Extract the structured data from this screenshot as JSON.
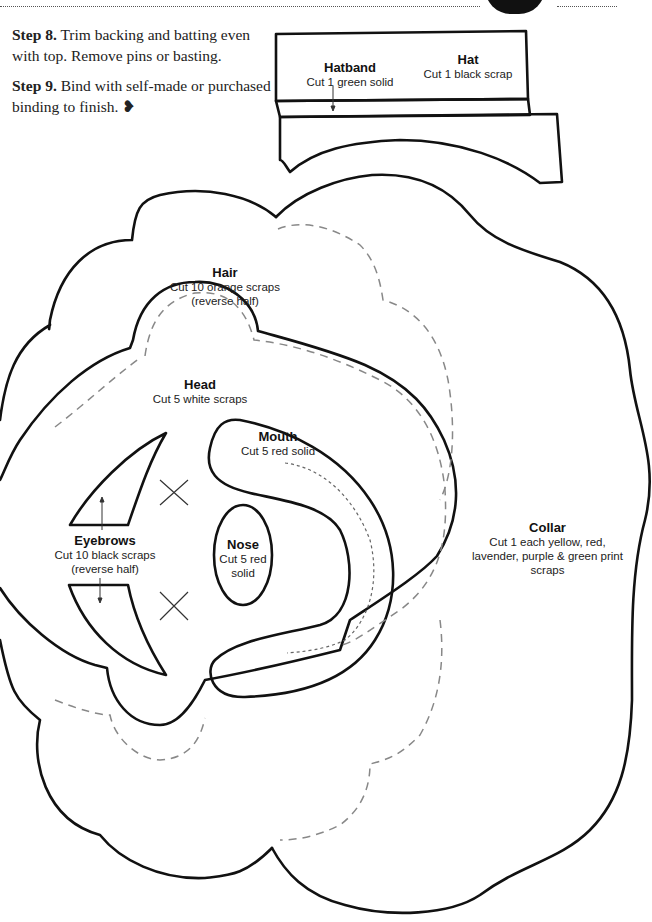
{
  "steps": [
    {
      "label": "Step 8.",
      "text": "Trim backing and batting even with top. Remove pins or basting."
    },
    {
      "label": "Step 9.",
      "text": "Bind with self-made or purchased binding to finish.",
      "end_mark": "❥"
    }
  ],
  "pieces": {
    "hatband": {
      "title": "Hatband",
      "line1": "Cut 1 green solid"
    },
    "hat": {
      "title": "Hat",
      "line1": "Cut 1 black scrap"
    },
    "hair": {
      "title": "Hair",
      "line1": "Cut 10 orange scraps",
      "line2": "(reverse half)"
    },
    "head": {
      "title": "Head",
      "line1": "Cut 5 white scraps"
    },
    "mouth": {
      "title": "Mouth",
      "line1": "Cut 5 red solid"
    },
    "eyebrows": {
      "title": "Eyebrows",
      "line1": "Cut 10 black scraps",
      "line2": "(reverse half)"
    },
    "nose": {
      "title": "Nose",
      "line1": "Cut 5 red",
      "line2": "solid"
    },
    "collar": {
      "title": "Collar",
      "line1": "Cut 1 each yellow, red,",
      "line2": "lavender, purple & green print",
      "line3": "scraps"
    }
  },
  "colors": {
    "outline": "#111111",
    "seam": "#888888",
    "text": "#222222"
  }
}
